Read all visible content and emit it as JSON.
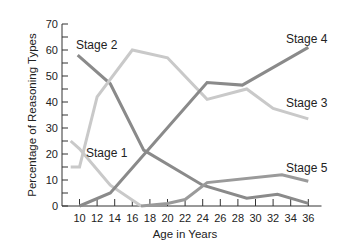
{
  "chart_data": {
    "type": "line",
    "title": "",
    "xlabel": "Age in Years",
    "ylabel": "Percentage of Reasoning Types",
    "xlim": [
      9,
      37
    ],
    "ylim": [
      0,
      70
    ],
    "x_ticks": [
      10,
      12,
      14,
      16,
      18,
      20,
      22,
      24,
      26,
      28,
      30,
      32,
      34,
      36
    ],
    "y_ticks": [
      0,
      10,
      20,
      30,
      40,
      50,
      60,
      70
    ],
    "grid": false,
    "legend_position": "inline labels",
    "series": [
      {
        "name": "Stage 1",
        "color": "#c9c9c9",
        "x": [
          9,
          10,
          13.5,
          17
        ],
        "y": [
          25,
          22,
          8,
          0
        ]
      },
      {
        "name": "Stage 2",
        "color": "#8a8a8a",
        "x": [
          9.8,
          13.5,
          17.3,
          24,
          29,
          32.5,
          36
        ],
        "y": [
          58,
          47,
          21.5,
          8,
          3,
          4.5,
          1
        ]
      },
      {
        "name": "Stage 3",
        "color": "#c9c9c9",
        "x": [
          9,
          10,
          12,
          16,
          20,
          24.5,
          29,
          32,
          36
        ],
        "y": [
          15,
          15,
          42,
          60,
          57,
          41,
          45,
          37.5,
          33.5
        ]
      },
      {
        "name": "Stage 4",
        "color": "#8a8a8a",
        "x": [
          10,
          13.5,
          24.5,
          28.5,
          36
        ],
        "y": [
          0,
          5,
          47.5,
          46.5,
          61
        ]
      },
      {
        "name": "Stage 5",
        "color": "#9a9a9a",
        "x": [
          17,
          20,
          22,
          24.5,
          33,
          36
        ],
        "y": [
          0,
          1,
          2.5,
          9,
          12,
          9.5
        ]
      }
    ],
    "annotations": [
      {
        "text": "Stage 2",
        "x": 76,
        "y": 49
      },
      {
        "text": "Stage 1",
        "x": 86,
        "y": 157
      },
      {
        "text": "Stage 4",
        "x": 286,
        "y": 43
      },
      {
        "text": "Stage 3",
        "x": 286,
        "y": 107
      },
      {
        "text": "Stage 5",
        "x": 286,
        "y": 172
      }
    ]
  }
}
